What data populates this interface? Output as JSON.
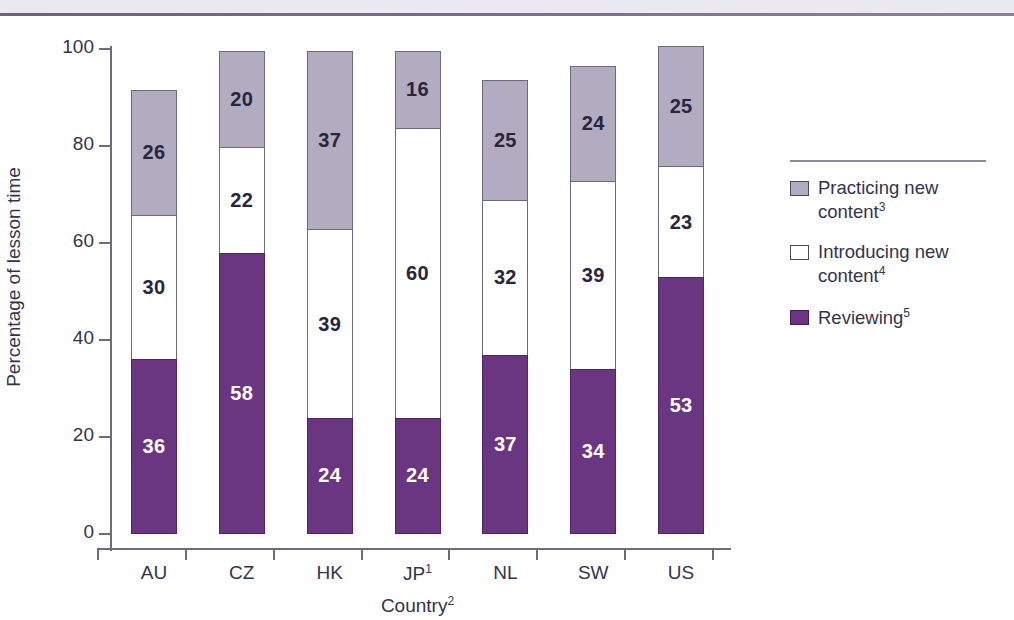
{
  "chart_data": {
    "type": "bar",
    "subtype": "stacked-vertical",
    "title": "",
    "xlabel": "Country",
    "xlabel_note": "2",
    "ylabel": "Percentage of lesson time",
    "ylim": [
      0,
      100
    ],
    "yticks": [
      0,
      20,
      40,
      60,
      80,
      100
    ],
    "grid": false,
    "legend_position": "right",
    "categories": [
      "AU",
      "CZ",
      "HK",
      "JP",
      "NL",
      "SW",
      "US"
    ],
    "category_notes": [
      "",
      "",
      "",
      "1",
      "",
      "",
      ""
    ],
    "series": [
      {
        "name": "Reviewing",
        "note": "5",
        "color": "#6a3681",
        "values": [
          36,
          58,
          24,
          24,
          37,
          34,
          53
        ]
      },
      {
        "name": "Introducing new content",
        "note": "4",
        "color": "#ffffff",
        "values": [
          30,
          22,
          39,
          60,
          32,
          39,
          23
        ]
      },
      {
        "name": "Practicing new content",
        "note": "3",
        "color": "#b3abc0",
        "values": [
          26,
          20,
          37,
          16,
          25,
          24,
          25
        ]
      }
    ],
    "totals": [
      92,
      100,
      100,
      100,
      94,
      97,
      101
    ]
  },
  "axes": {
    "y_title": "Percentage of lesson time",
    "x_title": "Country",
    "x_title_note": "2",
    "y_ticks": [
      "0",
      "20",
      "40",
      "60",
      "80",
      "100"
    ],
    "x_ticks": [
      "AU",
      "CZ",
      "HK",
      "JP",
      "NL",
      "SW",
      "US"
    ]
  },
  "legend": {
    "items": [
      {
        "label": "Practicing new content",
        "note": "3",
        "swatch": "#b3abc0"
      },
      {
        "label": "Introducing new content",
        "note": "4",
        "swatch": "#ffffff"
      },
      {
        "label": "Reviewing",
        "note": "5",
        "swatch": "#6a3681"
      }
    ]
  },
  "bars": [
    {
      "country": "AU",
      "note": "",
      "reviewing": "36",
      "introducing": "30",
      "practicing": "26"
    },
    {
      "country": "CZ",
      "note": "",
      "reviewing": "58",
      "introducing": "22",
      "practicing": "20"
    },
    {
      "country": "HK",
      "note": "",
      "reviewing": "24",
      "introducing": "39",
      "practicing": "37"
    },
    {
      "country": "JP",
      "note": "1",
      "reviewing": "24",
      "introducing": "60",
      "practicing": "16"
    },
    {
      "country": "NL",
      "note": "",
      "reviewing": "37",
      "introducing": "32",
      "practicing": "25"
    },
    {
      "country": "SW",
      "note": "",
      "reviewing": "34",
      "introducing": "39",
      "practicing": "24"
    },
    {
      "country": "US",
      "note": "",
      "reviewing": "53",
      "introducing": "23",
      "practicing": "25"
    }
  ],
  "colors": {
    "reviewing": "#6a3681",
    "practicing": "#b3abc0",
    "introducing": "#ffffff",
    "axis": "#6c6c7d",
    "text": "#33334d",
    "rule": "#6f5d86"
  }
}
